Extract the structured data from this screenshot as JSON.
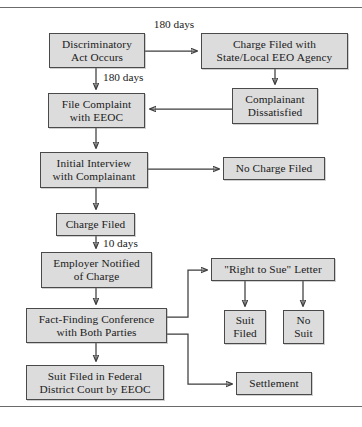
{
  "diagram": {
    "box_fill": "#dcdcdc",
    "box_border": "#4a4a4a",
    "line_color": "#3d3d3d",
    "nodes": [
      {
        "id": "discriminatory-act",
        "line1": "Discriminatory",
        "line2": "Act Occurs"
      },
      {
        "id": "charge-filed-state",
        "line1": "Charge Filed with",
        "line2": "State/Local EEO Agency"
      },
      {
        "id": "file-complaint-eeoc",
        "line1": "File Complaint",
        "line2": "with EEOC"
      },
      {
        "id": "complainant-dissatisfied",
        "line1": "Complainant",
        "line2": "Dissatisfied"
      },
      {
        "id": "initial-interview",
        "line1": "Initial Interview",
        "line2": "with Complainant"
      },
      {
        "id": "no-charge-filed",
        "line1": "No Charge Filed",
        "line2": ""
      },
      {
        "id": "charge-filed",
        "line1": "Charge Filed",
        "line2": ""
      },
      {
        "id": "employer-notified",
        "line1": "Employer Notified",
        "line2": "of Charge"
      },
      {
        "id": "right-to-sue",
        "line1": "\"Right to Sue\" Letter",
        "line2": ""
      },
      {
        "id": "fact-finding-conference",
        "line1": "Fact-Finding Conference",
        "line2": "with Both Parties"
      },
      {
        "id": "suit-filed",
        "line1": "Suit",
        "line2": "Filed"
      },
      {
        "id": "no-suit",
        "line1": "No",
        "line2": "Suit"
      },
      {
        "id": "suit-filed-federal",
        "line1": "Suit Filed in Federal",
        "line2": "District Court by EEOC"
      },
      {
        "id": "settlement",
        "line1": "Settlement",
        "line2": ""
      }
    ],
    "edge_labels": [
      {
        "id": "label-180-days-top",
        "line1": "180",
        "line2": "days"
      },
      {
        "id": "label-180-days-down",
        "line1": "180 days",
        "line2": ""
      },
      {
        "id": "label-10-days",
        "line1": "10 days",
        "line2": ""
      }
    ]
  }
}
